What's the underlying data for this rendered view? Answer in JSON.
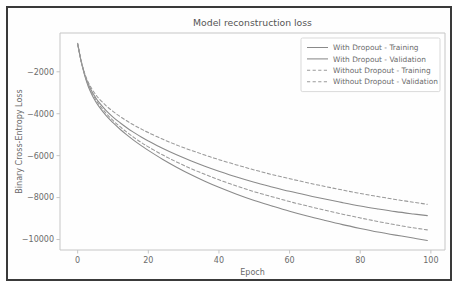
{
  "figure": {
    "border_color": "#3a3a3a",
    "background": "#fefefe"
  },
  "chart_data": {
    "type": "line",
    "title": "Model reconstruction loss",
    "xlabel": "Epoch",
    "ylabel": "Binary Cross-Entropy Loss",
    "xlim": [
      -5,
      104
    ],
    "ylim": [
      -10500,
      -150
    ],
    "xticks": [
      0,
      20,
      40,
      60,
      80,
      100
    ],
    "xtick_labels": [
      "0",
      "20",
      "40",
      "60",
      "80",
      "100"
    ],
    "yticks": [
      -2000,
      -4000,
      -6000,
      -8000,
      -10000
    ],
    "ytick_labels": [
      "−2000",
      "−4000",
      "−6000",
      "−8000",
      "−10000"
    ],
    "grid": false,
    "legend_position": "upper right",
    "line_color": "#8a8a8a",
    "series": [
      {
        "name": "With Dropout - Training",
        "style": "solid",
        "color": "#8a8a8a",
        "x": [
          0,
          1,
          2,
          3,
          4,
          5,
          6,
          8,
          10,
          12,
          14,
          16,
          18,
          20,
          24,
          28,
          32,
          36,
          40,
          45,
          50,
          55,
          60,
          65,
          70,
          75,
          80,
          85,
          90,
          95,
          99
        ],
        "y": [
          -650,
          -1500,
          -2180,
          -2700,
          -3080,
          -3390,
          -3650,
          -4080,
          -4430,
          -4740,
          -5020,
          -5280,
          -5520,
          -5750,
          -6170,
          -6550,
          -6900,
          -7220,
          -7510,
          -7840,
          -8140,
          -8400,
          -8650,
          -8880,
          -9090,
          -9290,
          -9470,
          -9640,
          -9790,
          -9930,
          -10050
        ]
      },
      {
        "name": "With Dropout - Validation",
        "style": "solid",
        "color": "#8a8a8a",
        "x": [
          0,
          1,
          2,
          3,
          4,
          5,
          6,
          8,
          10,
          12,
          14,
          16,
          18,
          20,
          24,
          28,
          32,
          36,
          40,
          45,
          50,
          55,
          60,
          65,
          70,
          75,
          80,
          85,
          90,
          95,
          99
        ],
        "y": [
          -700,
          -1520,
          -2120,
          -2580,
          -2930,
          -3210,
          -3450,
          -3840,
          -4160,
          -4430,
          -4680,
          -4900,
          -5110,
          -5300,
          -5650,
          -5960,
          -6240,
          -6500,
          -6740,
          -7020,
          -7270,
          -7490,
          -7700,
          -7890,
          -8070,
          -8240,
          -8400,
          -8540,
          -8670,
          -8780,
          -8860
        ]
      },
      {
        "name": "Without Dropout - Training",
        "style": "dashed",
        "color": "#9a9a9a",
        "x": [
          0,
          1,
          2,
          3,
          4,
          5,
          6,
          8,
          10,
          12,
          14,
          16,
          18,
          20,
          24,
          28,
          32,
          36,
          40,
          45,
          50,
          55,
          60,
          65,
          70,
          75,
          80,
          85,
          90,
          95,
          99
        ],
        "y": [
          -640,
          -1480,
          -2080,
          -2500,
          -2810,
          -3060,
          -3270,
          -3610,
          -3890,
          -4130,
          -4350,
          -4550,
          -4730,
          -4900,
          -5210,
          -5490,
          -5740,
          -5970,
          -6190,
          -6440,
          -6680,
          -6900,
          -7100,
          -7290,
          -7470,
          -7640,
          -7800,
          -7950,
          -8090,
          -8220,
          -8320
        ]
      },
      {
        "name": "Without Dropout - Validation",
        "style": "dashed",
        "color": "#9a9a9a",
        "x": [
          0,
          1,
          2,
          3,
          4,
          5,
          6,
          8,
          10,
          12,
          14,
          16,
          18,
          20,
          24,
          28,
          32,
          36,
          40,
          45,
          50,
          55,
          60,
          65,
          70,
          75,
          80,
          85,
          90,
          95,
          99
        ],
        "y": [
          -660,
          -1500,
          -2140,
          -2620,
          -2990,
          -3290,
          -3550,
          -3970,
          -4320,
          -4620,
          -4890,
          -5140,
          -5370,
          -5580,
          -5960,
          -6300,
          -6610,
          -6890,
          -7150,
          -7450,
          -7720,
          -7960,
          -8190,
          -8400,
          -8600,
          -8790,
          -8970,
          -9140,
          -9300,
          -9440,
          -9540
        ]
      }
    ]
  }
}
